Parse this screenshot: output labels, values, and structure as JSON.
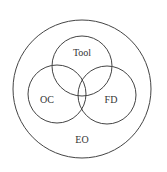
{
  "diagram": {
    "type": "venn",
    "outer": {
      "label": "EO",
      "cx": 82,
      "cy": 89,
      "r": 69,
      "label_x": 82,
      "label_y": 141
    },
    "sets": [
      {
        "label": "Tool",
        "cx": 82,
        "cy": 66,
        "r": 30,
        "label_x": 82,
        "label_y": 54
      },
      {
        "label": "OC",
        "cx": 57,
        "cy": 94,
        "r": 29,
        "label_x": 47,
        "label_y": 101
      },
      {
        "label": "FD",
        "cx": 107,
        "cy": 95,
        "r": 29,
        "label_x": 111,
        "label_y": 101
      }
    ],
    "stroke_color": "#444444",
    "text_color": "#333333"
  }
}
